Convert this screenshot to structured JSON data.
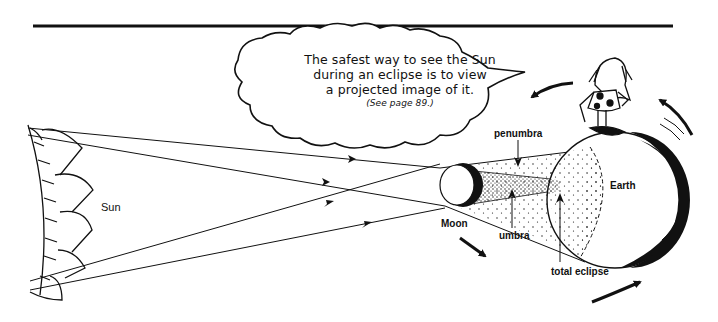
{
  "diagram": {
    "speech_bubble": {
      "lines": [
        "The safest way to see the Sun",
        "during an eclipse is to view",
        "a projected image of it."
      ],
      "note": "(See page 89.)"
    },
    "labels": {
      "sun": "Sun",
      "moon": "Moon",
      "earth": "Earth",
      "penumbra": "penumbra",
      "umbra": "umbra",
      "total_eclipse": "total eclipse"
    },
    "elements": [
      "top-rule",
      "sun-limb",
      "light-rays",
      "moon",
      "penumbra-cone",
      "umbra-cone",
      "earth",
      "cave-person-figure",
      "orbit-motion-arrows"
    ],
    "colors": {
      "ink": "#111111",
      "background": "#ffffff"
    }
  }
}
